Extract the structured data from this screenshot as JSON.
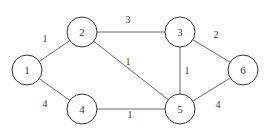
{
  "graph": {
    "nodes": [
      {
        "id": "1",
        "label": "1",
        "x": 27,
        "y": 70
      },
      {
        "id": "2",
        "label": "2",
        "x": 82,
        "y": 32
      },
      {
        "id": "3",
        "label": "3",
        "x": 180,
        "y": 32
      },
      {
        "id": "4",
        "label": "4",
        "x": 82,
        "y": 109
      },
      {
        "id": "5",
        "label": "5",
        "x": 180,
        "y": 109
      },
      {
        "id": "6",
        "label": "6",
        "x": 243,
        "y": 70
      }
    ],
    "edges": [
      {
        "from": "1",
        "to": "2",
        "weight": "1",
        "lx": 45,
        "ly": 42
      },
      {
        "from": "1",
        "to": "4",
        "weight": "4",
        "lx": 45,
        "ly": 107
      },
      {
        "from": "2",
        "to": "3",
        "weight": "3",
        "lx": 128,
        "ly": 23
      },
      {
        "from": "2",
        "to": "5",
        "weight": "1",
        "lx": 128,
        "ly": 65
      },
      {
        "from": "4",
        "to": "5",
        "weight": "1",
        "lx": 130,
        "ly": 118
      },
      {
        "from": "3",
        "to": "5",
        "weight": "1",
        "lx": 187,
        "ly": 74
      },
      {
        "from": "3",
        "to": "6",
        "weight": "2",
        "lx": 216,
        "ly": 38
      },
      {
        "from": "5",
        "to": "6",
        "weight": "4",
        "lx": 218,
        "ly": 108
      }
    ]
  }
}
